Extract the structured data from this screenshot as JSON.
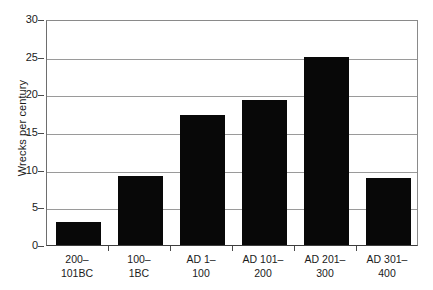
{
  "chart_data": {
    "type": "bar",
    "title": "",
    "subtitle": "",
    "xlabel": "",
    "ylabel": "Wrecks per century",
    "categories": [
      "200–101BC",
      "100–1BC",
      "AD 1–100",
      "AD 101–200",
      "AD 201–300",
      "AD 301–400"
    ],
    "category_lines": [
      [
        "200–",
        "101BC"
      ],
      [
        "100–",
        "1BC"
      ],
      [
        "AD 1–",
        "100"
      ],
      [
        "AD 101–",
        "200"
      ],
      [
        "AD 201–",
        "300"
      ],
      [
        "AD 301–",
        "400"
      ]
    ],
    "values": [
      3.0,
      9.2,
      17.2,
      19.2,
      25.0,
      8.9
    ],
    "ylim": [
      0,
      30
    ],
    "ytick_values": [
      0,
      5,
      10,
      15,
      20,
      25,
      30
    ],
    "ytick_labels": [
      "0",
      "5",
      "10",
      "15",
      "20",
      "25",
      "30"
    ],
    "grid": "horizontal",
    "legend": "none",
    "bar_color": "#080808",
    "gridline_color": "#9a9a9a",
    "axis_color": "#3d3d3d",
    "background_color": "#ffffff"
  }
}
